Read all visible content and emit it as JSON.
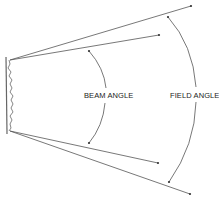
{
  "diagram": {
    "labels": {
      "beam_angle": "BEAM ANGLE",
      "field_angle": "FIELD ANGLE"
    },
    "colors": {
      "line": "#555555",
      "text": "#222222"
    }
  }
}
